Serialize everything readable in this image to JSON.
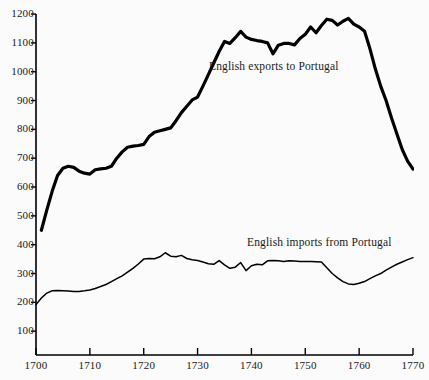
{
  "chart_data": {
    "type": "line",
    "title": "",
    "subtitle": "",
    "xlabel": "",
    "ylabel": "",
    "xlim": [
      1700,
      1770
    ],
    "ylim": [
      0,
      1200
    ],
    "grid": false,
    "legend_position": "inline-annotation",
    "x_ticks": [
      "1700",
      "1710",
      "1720",
      "1730",
      "1740",
      "1750",
      "1760",
      "1770"
    ],
    "x_tick_values": [
      1700,
      1710,
      1720,
      1730,
      1740,
      1750,
      1760,
      1770
    ],
    "y_ticks": [
      "100",
      "200",
      "300",
      "400",
      "500",
      "600",
      "700",
      "800",
      "900",
      "1000",
      "1100",
      "1200"
    ],
    "y_tick_values": [
      100,
      200,
      300,
      400,
      500,
      600,
      700,
      800,
      900,
      1000,
      1100,
      1200
    ],
    "line_color": "#000000",
    "background_color": "#fbfbfb",
    "axis_color": "#000000",
    "series": [
      {
        "name": "English exports to Portugal",
        "label": "English exports to Portugal",
        "line_width": 3.2,
        "x": [
          1701,
          1702,
          1703,
          1704,
          1705,
          1706,
          1707,
          1708,
          1709,
          1710,
          1711,
          1712,
          1713,
          1714,
          1715,
          1716,
          1717,
          1718,
          1719,
          1720,
          1721,
          1722,
          1723,
          1724,
          1725,
          1726,
          1727,
          1728,
          1729,
          1730,
          1731,
          1732,
          1733,
          1734,
          1735,
          1736,
          1737,
          1738,
          1739,
          1740,
          1741,
          1742,
          1743,
          1744,
          1745,
          1746,
          1747,
          1748,
          1749,
          1750,
          1751,
          1752,
          1753,
          1754,
          1755,
          1756,
          1757,
          1758,
          1759,
          1760,
          1761,
          1762,
          1763,
          1764,
          1765,
          1766,
          1767,
          1768,
          1769,
          1770
        ],
        "y": [
          450,
          520,
          585,
          640,
          665,
          672,
          668,
          655,
          648,
          645,
          660,
          663,
          665,
          672,
          700,
          722,
          738,
          742,
          744,
          748,
          775,
          790,
          795,
          800,
          805,
          830,
          858,
          880,
          902,
          912,
          950,
          990,
          1030,
          1070,
          1105,
          1098,
          1118,
          1140,
          1120,
          1112,
          1108,
          1105,
          1100,
          1062,
          1092,
          1098,
          1098,
          1093,
          1115,
          1130,
          1155,
          1135,
          1160,
          1182,
          1178,
          1162,
          1175,
          1185,
          1165,
          1155,
          1140,
          1080,
          1010,
          950,
          900,
          840,
          785,
          730,
          690,
          662
        ]
      },
      {
        "name": "English imports from Portugal",
        "label": "English imports from Portugal",
        "line_width": 1.5,
        "x": [
          1700,
          1701,
          1702,
          1703,
          1704,
          1705,
          1706,
          1707,
          1708,
          1709,
          1710,
          1711,
          1712,
          1713,
          1714,
          1715,
          1716,
          1717,
          1718,
          1719,
          1720,
          1721,
          1722,
          1723,
          1724,
          1725,
          1726,
          1727,
          1728,
          1729,
          1730,
          1731,
          1732,
          1733,
          1734,
          1735,
          1736,
          1737,
          1738,
          1739,
          1740,
          1741,
          1742,
          1743,
          1744,
          1745,
          1746,
          1747,
          1748,
          1749,
          1750,
          1751,
          1752,
          1753,
          1754,
          1755,
          1756,
          1757,
          1758,
          1759,
          1760,
          1761,
          1762,
          1763,
          1764,
          1765,
          1766,
          1767,
          1768,
          1769,
          1770
        ],
        "y": [
          192,
          215,
          232,
          240,
          241,
          240,
          239,
          238,
          238,
          240,
          243,
          248,
          255,
          262,
          272,
          282,
          292,
          305,
          318,
          333,
          350,
          352,
          351,
          358,
          372,
          360,
          358,
          363,
          352,
          348,
          345,
          340,
          334,
          332,
          345,
          330,
          318,
          322,
          338,
          310,
          327,
          332,
          330,
          344,
          345,
          344,
          342,
          344,
          343,
          342,
          342,
          342,
          341,
          340,
          320,
          300,
          285,
          272,
          264,
          262,
          266,
          272,
          282,
          292,
          300,
          312,
          322,
          332,
          340,
          348,
          355
        ]
      }
    ]
  },
  "annotations": [
    {
      "name": "exports-label",
      "text": "English exports to Portugal"
    },
    {
      "name": "imports-label",
      "text": "English imports from Portugal"
    }
  ]
}
